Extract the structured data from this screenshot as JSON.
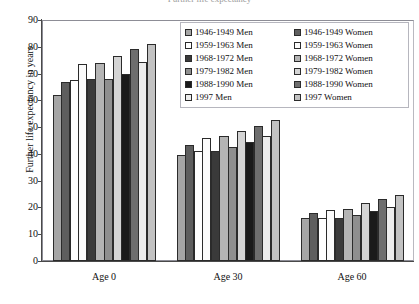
{
  "title": {
    "text": "Further life expectancy",
    "visible_partially": true
  },
  "axes": {
    "y_title": "Further life expectancy in years",
    "y_ticks": [
      "90",
      "80",
      "70",
      "60",
      "50",
      "40",
      "30",
      "20",
      "10",
      "0"
    ],
    "x_groups": [
      "Age 0",
      "Age 30",
      "Age 60"
    ]
  },
  "legend": {
    "left_column": [
      {
        "label": "1946-1949 Men",
        "color": "#a6a6a6"
      },
      {
        "label": "1959-1963 Men",
        "color": "#ffffff"
      },
      {
        "label": "1968-1972 Men",
        "color": "#3a3a3a"
      },
      {
        "label": "1979-1982 Men",
        "color": "#8f8f8f"
      },
      {
        "label": "1988-1990 Men",
        "color": "#1a1a1a"
      },
      {
        "label": "1997 Men",
        "color": "#ededed"
      }
    ],
    "right_column": [
      {
        "label": "1946-1949 Women",
        "color": "#5e5e5e"
      },
      {
        "label": "1959-1963 Women",
        "color": "#fbfbfb"
      },
      {
        "label": "1968-1972 Women",
        "color": "#b4b4b4"
      },
      {
        "label": "1979-1982 Women",
        "color": "#d4d4d4"
      },
      {
        "label": "1988-1990 Women",
        "color": "#6e6e6e"
      },
      {
        "label": "1997 Women",
        "color": "#c2c2c2"
      }
    ]
  },
  "chart_data": {
    "type": "bar",
    "title": "Further life expectancy",
    "xlabel": "",
    "ylabel": "Further life expectancy in years",
    "ylim": [
      0,
      90
    ],
    "ytick_step": 10,
    "grid": false,
    "legend_position": "top-right-inside",
    "categories": [
      "Age 0",
      "Age 30",
      "Age 60"
    ],
    "series": [
      {
        "name": "1946-1949 Men",
        "color": "#a6a6a6",
        "values": [
          62.0,
          39.5,
          16.0
        ]
      },
      {
        "name": "1946-1949 Women",
        "color": "#5e5e5e",
        "values": [
          67.0,
          43.5,
          18.0
        ]
      },
      {
        "name": "1959-1963 Men",
        "color": "#ffffff",
        "values": [
          67.5,
          41.0,
          16.0
        ]
      },
      {
        "name": "1959-1963 Women",
        "color": "#fbfbfb",
        "values": [
          73.5,
          46.0,
          19.0
        ]
      },
      {
        "name": "1968-1972 Men",
        "color": "#3a3a3a",
        "values": [
          68.0,
          41.0,
          16.0
        ]
      },
      {
        "name": "1968-1972 Women",
        "color": "#b4b4b4",
        "values": [
          74.0,
          46.5,
          19.5
        ]
      },
      {
        "name": "1979-1982 Men",
        "color": "#8f8f8f",
        "values": [
          68.0,
          42.5,
          17.0
        ]
      },
      {
        "name": "1979-1982 Women",
        "color": "#d4d4d4",
        "values": [
          76.5,
          48.5,
          21.5
        ]
      },
      {
        "name": "1988-1990 Men",
        "color": "#1a1a1a",
        "values": [
          70.0,
          44.5,
          18.5
        ]
      },
      {
        "name": "1988-1990 Women",
        "color": "#6e6e6e",
        "values": [
          79.0,
          50.5,
          23.0
        ]
      },
      {
        "name": "1997 Men",
        "color": "#ededed",
        "values": [
          74.5,
          46.5,
          20.0
        ]
      },
      {
        "name": "1997 Women",
        "color": "#c2c2c2",
        "values": [
          81.0,
          52.5,
          24.5
        ]
      }
    ]
  }
}
